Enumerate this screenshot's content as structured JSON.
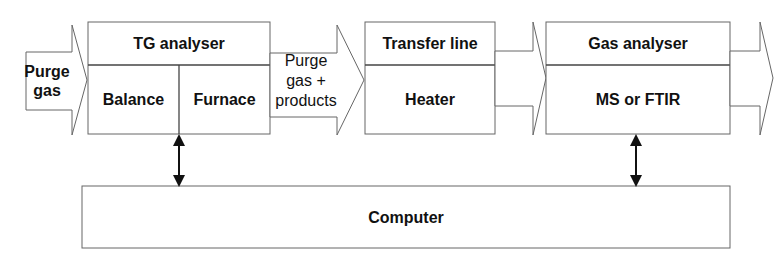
{
  "diagram": {
    "inlet_arrow": {
      "label": "Purge\ngas",
      "lines": [
        "Purge",
        "gas"
      ]
    },
    "tg_analyser": {
      "title": "TG analyser",
      "left_cell": "Balance",
      "right_cell": "Furnace"
    },
    "flow_arrow": {
      "lines": [
        "Purge",
        "gas +",
        "products"
      ]
    },
    "transfer_line": {
      "title": "Transfer line",
      "cell": "Heater"
    },
    "gas_analyser": {
      "title": "Gas analyser",
      "cell": "MS or FTIR"
    },
    "computer": {
      "label": "Computer"
    },
    "connections": [
      {
        "from": "tg_analyser",
        "to": "computer",
        "type": "bidirectional"
      },
      {
        "from": "gas_analyser",
        "to": "computer",
        "type": "bidirectional"
      }
    ],
    "colors": {
      "stroke": "#555555",
      "text": "#111111",
      "background": "#ffffff"
    }
  }
}
